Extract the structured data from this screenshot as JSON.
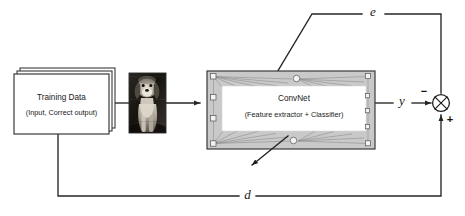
{
  "diagram": {
    "canvas": {
      "width": 465,
      "height": 216,
      "background": "#ffffff"
    },
    "colors": {
      "wire": "#262626",
      "box_stroke": "#3a3a3a",
      "convnet_fill": "#c9c9c9",
      "convnet_inner_fill": "#ffffff",
      "node_fill": "#f2f2f2",
      "node_stroke": "#555555",
      "edge": "#8a8a8a",
      "text": "#1a1a1a"
    },
    "nodes": {
      "training_data": {
        "label": "Training Data",
        "sublabel": "(Input, Correct output)",
        "shape": "stacked-rectangle"
      },
      "sample_image": {
        "alt": "grayscale photo of a puppy",
        "shape": "photo-thumbnail"
      },
      "convnet": {
        "label": "ConvNet",
        "sublabel": "(Feature extractor + Classifier)",
        "shape": "rectangle-with-neural-net-overlay"
      },
      "sum_junction": {
        "label": "⊕",
        "shape": "circle-with-cross",
        "minus_sign": "−",
        "plus_sign": "+"
      }
    },
    "signals": {
      "output": "y",
      "error": "e",
      "desired": "d"
    },
    "icons": {
      "arrow": "arrowhead",
      "backprop_arrow": "down-left-arrow"
    }
  }
}
